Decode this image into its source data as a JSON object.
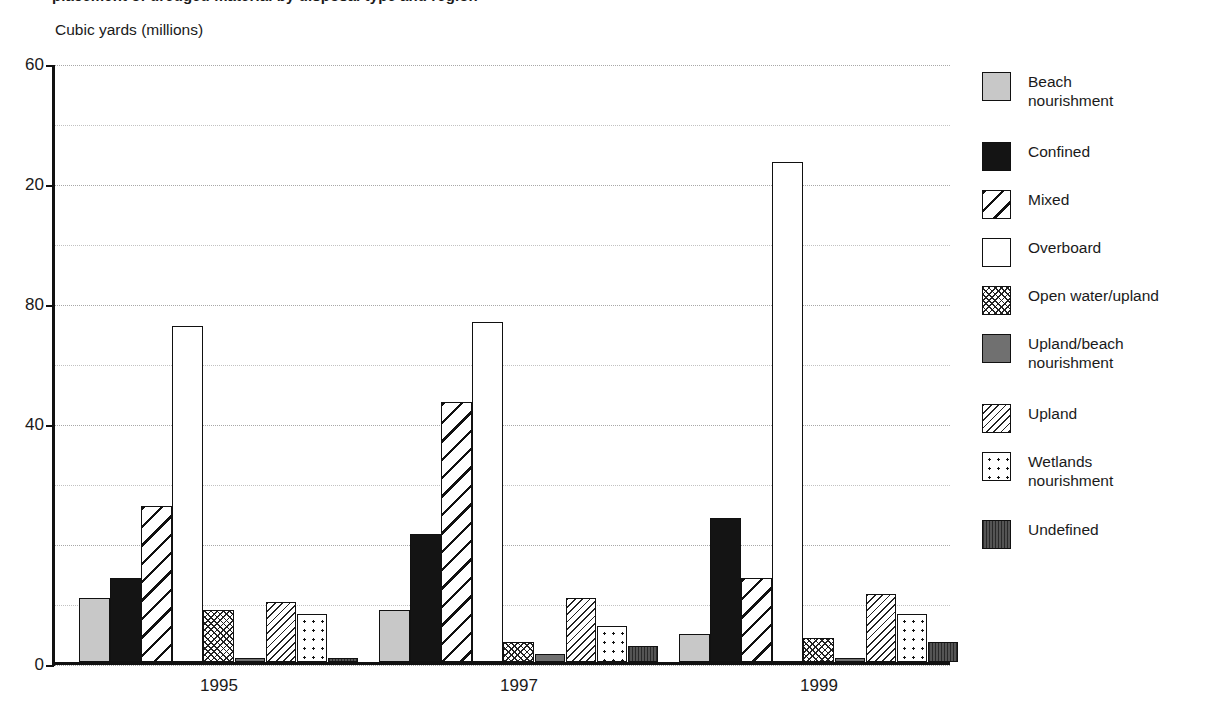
{
  "title": {
    "clipped_text": "placement of dredged material by disposal type and region",
    "note_visible": "top line cropped by scan"
  },
  "axis": {
    "unit_caption": "Cubic yards (millions)",
    "y_tick_labels": [
      "60",
      "20",
      "80",
      "40",
      "0"
    ],
    "x_tick_labels": [
      "1995",
      "1997",
      "1999"
    ]
  },
  "legend": {
    "items": [
      {
        "label": "Beach\nnourishment",
        "pattern": "solid-light-gray",
        "color": "#c8c8c8"
      },
      {
        "label": "Confined",
        "pattern": "solid-black",
        "color": "#141414"
      },
      {
        "label": "Mixed",
        "pattern": "wide-diagonal-hatch",
        "color": "#ffffff"
      },
      {
        "label": "Overboard",
        "pattern": "plain-white",
        "color": "#ffffff"
      },
      {
        "label": "Open water/upland",
        "pattern": "fine-cross-hatch",
        "color": "#ffffff"
      },
      {
        "label": "Upland/beach\nnourishment",
        "pattern": "solid-medium-gray",
        "color": "#707070"
      },
      {
        "label": "Upland",
        "pattern": "sparse-diagonal-hatch",
        "color": "#ffffff"
      },
      {
        "label": "Wetlands\nnourishment",
        "pattern": "dotted",
        "color": "#ffffff"
      },
      {
        "label": "Undefined",
        "pattern": "solid-dark-gray",
        "color": "#4a4a4a"
      }
    ]
  },
  "chart_data": {
    "type": "bar",
    "title": "",
    "xlabel": "",
    "ylabel": "Cubic yards (millions)",
    "categories": [
      "1995",
      "1997",
      "1999"
    ],
    "ylim": [
      0,
      150
    ],
    "y_tick_values": [
      150,
      120,
      90,
      60,
      30,
      0
    ],
    "y_tick_labels_as_printed": [
      "60",
      "20",
      "80",
      "40",
      "0"
    ],
    "grid": true,
    "grid_minor": true,
    "legend_position": "right",
    "series": [
      {
        "name": "Beach nourishment",
        "values": [
          16,
          13,
          7
        ]
      },
      {
        "name": "Confined",
        "values": [
          21,
          32,
          36
        ]
      },
      {
        "name": "Mixed",
        "values": [
          39,
          65,
          21
        ]
      },
      {
        "name": "Overboard",
        "values": [
          84,
          85,
          125
        ]
      },
      {
        "name": "Open water/upland",
        "values": [
          13,
          5,
          6
        ]
      },
      {
        "name": "Upland/beach nourishment",
        "values": [
          1,
          2,
          1
        ]
      },
      {
        "name": "Upland",
        "values": [
          15,
          16,
          17
        ]
      },
      {
        "name": "Wetlands nourishment",
        "values": [
          12,
          9,
          12
        ]
      },
      {
        "name": "Undefined",
        "values": [
          1,
          4,
          5
        ]
      }
    ]
  }
}
